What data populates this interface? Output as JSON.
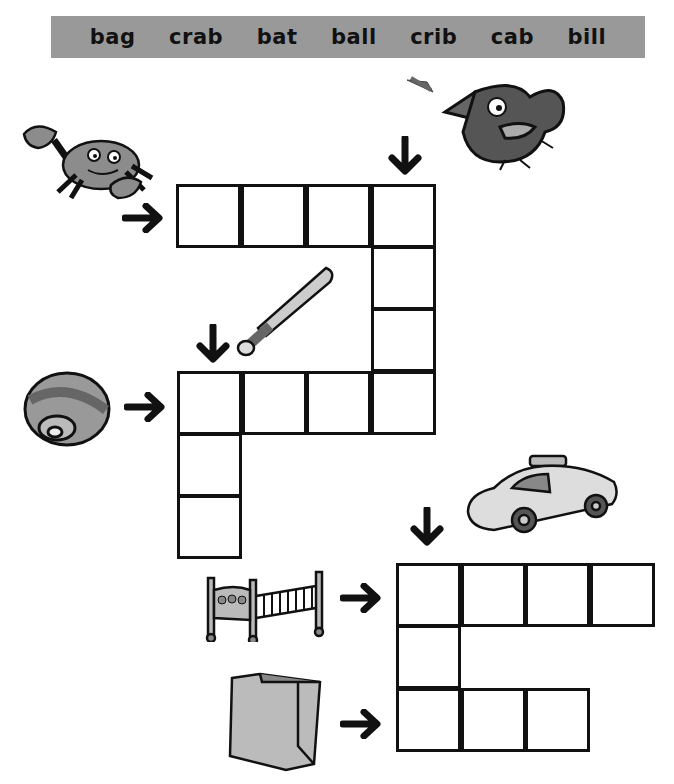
{
  "word_bank": {
    "words": [
      "bag",
      "crab",
      "bat",
      "ball",
      "crib",
      "cab",
      "bill"
    ]
  },
  "puzzle": {
    "type": "picture-crossword",
    "clues": [
      {
        "picture": "crab",
        "direction": "across",
        "length": 4
      },
      {
        "picture": "bill",
        "direction": "down",
        "length": 4
      },
      {
        "picture": "bat",
        "direction": "down",
        "length": 3
      },
      {
        "picture": "ball",
        "direction": "across",
        "length": 4
      },
      {
        "picture": "cab",
        "direction": "down",
        "length": 3
      },
      {
        "picture": "crib",
        "direction": "across",
        "length": 4
      },
      {
        "picture": "bag",
        "direction": "across",
        "length": 3
      }
    ]
  },
  "colors": {
    "word_bank_bg": "#999999",
    "ink": "#111111",
    "illustration_gray": "#8c8c8c"
  }
}
